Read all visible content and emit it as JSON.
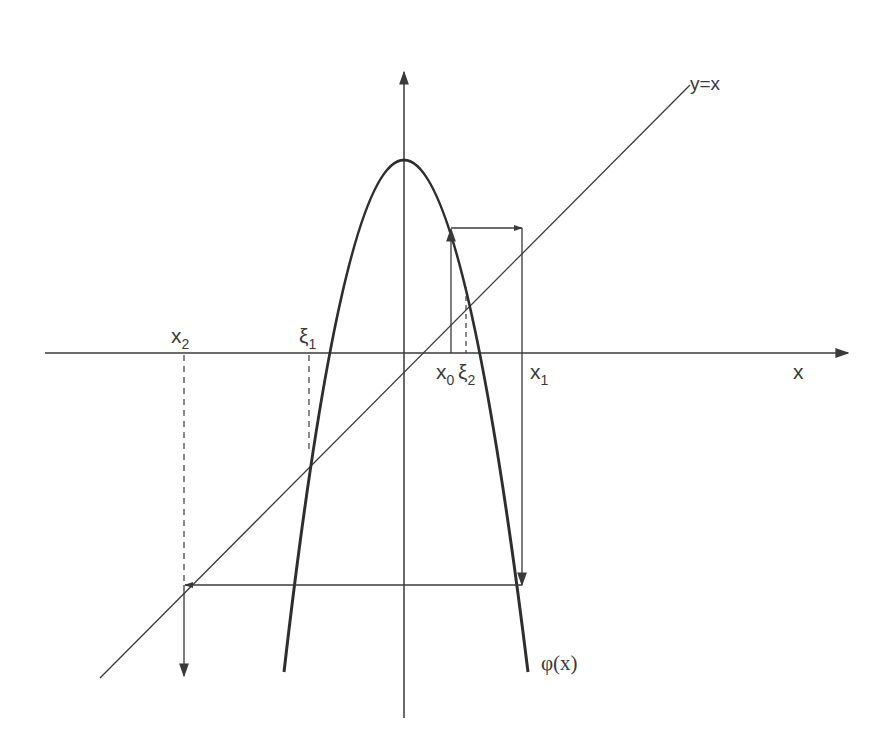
{
  "diagram": {
    "colors": {
      "stroke": "#3a3a3a",
      "background": "#ffffff"
    },
    "axes": {
      "x_label": "x",
      "y_label": ""
    },
    "curves": {
      "identity_label": "y=x",
      "phi_label": "φ(x)"
    },
    "points": {
      "x0": {
        "base": "x",
        "sub": "0"
      },
      "x1": {
        "base": "x",
        "sub": "1"
      },
      "x2": {
        "base": "x",
        "sub": "2"
      },
      "xi1": {
        "base": "ξ",
        "sub": "1"
      },
      "xi2": {
        "base": "ξ",
        "sub": "2"
      }
    }
  }
}
